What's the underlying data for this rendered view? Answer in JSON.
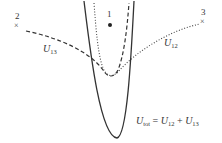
{
  "diagram": {
    "points": [
      {
        "id": "point-1",
        "label": "1",
        "marker": "dot"
      },
      {
        "id": "point-2",
        "label": "2",
        "marker": "×"
      },
      {
        "id": "point-3",
        "label": "3",
        "marker": "×"
      }
    ],
    "curves": [
      {
        "id": "U13",
        "style": "dashed",
        "label_main": "U",
        "label_sub": "13"
      },
      {
        "id": "U12",
        "style": "dotted",
        "label_main": "U",
        "label_sub": "12"
      },
      {
        "id": "Utot",
        "style": "solid",
        "label_main": "U",
        "label_sub": "tot"
      }
    ],
    "equation": {
      "lhs_main": "U",
      "lhs_sub": "tot",
      "equals": "=",
      "t1_main": "U",
      "t1_sub": "12",
      "plus": "+",
      "t2_main": "U",
      "t2_sub": "13"
    },
    "colors": {
      "stroke": "#333333",
      "background": "#ffffff"
    }
  }
}
